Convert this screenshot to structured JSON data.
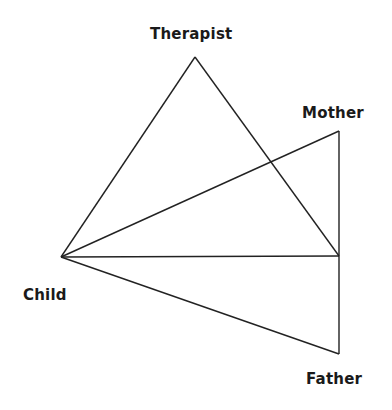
{
  "diagram": {
    "type": "relationship-triangles",
    "line_color": "#222222",
    "nodes": {
      "therapist": {
        "label": "Therapist",
        "x": 195,
        "y": 57
      },
      "mother": {
        "label": "Mother",
        "x": 339,
        "y": 131
      },
      "child": {
        "label": "Child",
        "x": 61,
        "y": 257
      },
      "junction": {
        "label": "",
        "x": 339,
        "y": 256
      },
      "father": {
        "label": "Father",
        "x": 339,
        "y": 354
      }
    },
    "edges": [
      {
        "from": "child",
        "to": "therapist"
      },
      {
        "from": "therapist",
        "to": "junction"
      },
      {
        "from": "child",
        "to": "mother"
      },
      {
        "from": "mother",
        "to": "junction"
      },
      {
        "from": "child",
        "to": "junction"
      },
      {
        "from": "junction",
        "to": "father"
      },
      {
        "from": "child",
        "to": "father"
      }
    ]
  }
}
